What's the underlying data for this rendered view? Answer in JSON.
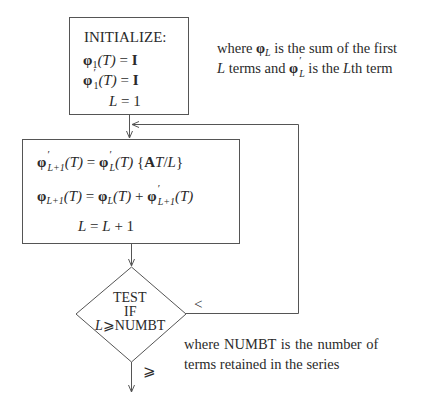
{
  "diagram": {
    "type": "flowchart",
    "init_box": {
      "title": "INITIALIZE:",
      "lines": [
        {
          "lhs_sym": "φ",
          "lhs_sub": "1",
          "lhs_prime": "",
          "arg": "(T)",
          "eq": " = ",
          "rhs": "I"
        },
        {
          "lhs_sym": "φ",
          "lhs_sub": "1",
          "lhs_prime": "′",
          "arg": "(T)",
          "eq": " = ",
          "rhs": "I"
        },
        {
          "text_var": "L",
          "eq": " = ",
          "rhs": "1"
        }
      ]
    },
    "init_note": {
      "line1_a": "where ",
      "line1_sym": "φ",
      "line1_sub": "L",
      "line1_b": " is the sum of the first",
      "line2_var": "L",
      "line2_a": " terms and ",
      "line2_sym": "φ",
      "line2_sub": "L",
      "line2_prime": "′",
      "line2_b": " is the ",
      "line2_var2": "L",
      "line2_c": "th term"
    },
    "process_box": {
      "line1": {
        "lhs_sym": "φ",
        "lhs_prime": "′",
        "lhs_sub": "L+1",
        "lhs_arg": "(T)",
        "eq": " = ",
        "r_sym": "φ",
        "r_prime": "′",
        "r_sub": "L",
        "r_arg": "(T)",
        "r_brace_open": " {",
        "r_A": "A",
        "r_T": "T",
        "r_slash": "/",
        "r_L": "L",
        "r_brace_close": "}"
      },
      "line2": {
        "lhs_sym": "φ",
        "lhs_sub": "L+1",
        "lhs_arg": "(T)",
        "eq": " = ",
        "r1_sym": "φ",
        "r1_sub": "L",
        "r1_arg": "(T)",
        "plus": " + ",
        "r2_sym": "φ",
        "r2_prime": "′",
        "r2_sub": "L+1",
        "r2_arg": "(T)"
      },
      "line3": {
        "var": "L",
        "eq": " = ",
        "rhs_var": "L",
        "rhs_rest": " + 1"
      }
    },
    "decision": {
      "line1": "TEST",
      "line2": "IF",
      "line3_var": "L",
      "line3_rest": "⩾NUMBT",
      "loop_label": "<",
      "exit_label": "⩾"
    },
    "decision_note": {
      "line1": "where  NUMBT  is  the  number  of",
      "line2": "terms retained in the series"
    },
    "colors": {
      "line": "#555555",
      "text": "#2a2a2a",
      "background": "#ffffff"
    }
  }
}
